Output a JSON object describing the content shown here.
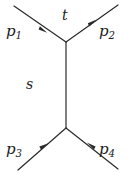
{
  "diagram": {
    "type": "feynman-diagram",
    "background_color": "#ffffff",
    "line_color": "#2a2a2a",
    "label_color": "#1b1b1b",
    "width": 132,
    "height": 173,
    "vertices": [
      {
        "name": "upper-vertex",
        "x": 66,
        "y": 42
      },
      {
        "name": "lower-vertex",
        "x": 66,
        "y": 128
      }
    ],
    "internal_line": {
      "name": "s-channel-propagator",
      "from": [
        66,
        42
      ],
      "to": [
        66,
        128
      ],
      "label": "s"
    },
    "legs": [
      {
        "name": "leg-p1",
        "label_base": "p",
        "label_sub": "1",
        "from": [
          14,
          6
        ],
        "to": [
          66,
          42
        ],
        "arrow_direction": "toward-vertex",
        "arrow_at": [
          43,
          30
        ]
      },
      {
        "name": "leg-p2",
        "label_base": "p",
        "label_sub": "2",
        "from": [
          66,
          42
        ],
        "to": [
          118,
          5
        ],
        "arrow_direction": "away-from-vertex",
        "arrow_at": [
          92,
          23
        ]
      },
      {
        "name": "leg-p3",
        "label_base": "p",
        "label_sub": "3",
        "from": [
          18,
          170
        ],
        "to": [
          66,
          128
        ],
        "arrow_direction": "toward-vertex",
        "arrow_at": [
          44,
          146
        ]
      },
      {
        "name": "leg-p4",
        "label_base": "p",
        "label_sub": "4",
        "from": [
          118,
          169
        ],
        "to": [
          66,
          128
        ],
        "arrow_direction": "toward-vertex",
        "arrow_at": [
          91,
          146
        ]
      }
    ],
    "labels": {
      "p1": {
        "base": "p",
        "sub": "1"
      },
      "p2": {
        "base": "p",
        "sub": "2"
      },
      "p3": {
        "base": "p",
        "sub": "3"
      },
      "p4": {
        "base": "p",
        "sub": "4"
      },
      "t": "t",
      "s": "s"
    }
  }
}
